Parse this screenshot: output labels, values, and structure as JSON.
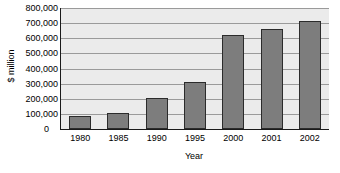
{
  "chart_data": {
    "type": "bar",
    "title": "",
    "subtitle": "",
    "xlabel": "Year",
    "ylabel": "$ million",
    "categories": [
      "1980",
      "1985",
      "1990",
      "1995",
      "2000",
      "2001",
      "2002"
    ],
    "values": [
      85000,
      105000,
      205000,
      310000,
      620000,
      660000,
      715000
    ],
    "series": [
      {
        "name": "$ million",
        "values": [
          85000,
          105000,
          205000,
          310000,
          620000,
          660000,
          715000
        ]
      }
    ],
    "ylim": [
      0,
      800000
    ],
    "ytick_values": [
      0,
      100000,
      200000,
      300000,
      400000,
      500000,
      600000,
      700000,
      800000
    ],
    "ytick_labels": [
      "0",
      "100,000",
      "200,000",
      "300,000",
      "400,000",
      "500,000",
      "600,000",
      "700,000",
      "800,000"
    ],
    "grid": true,
    "grid_axis": "y",
    "legend": false,
    "legend_position": "none",
    "annotations": [],
    "colors": {
      "bar_fill": "#7d7d7d",
      "bar_edge": "#2b2b2b",
      "plot_background": "#ebebeb",
      "gridline": "#9a9a9a",
      "axis_line": "#1a1a1a",
      "text": "#000000",
      "figure_background": "#ffffff"
    }
  }
}
